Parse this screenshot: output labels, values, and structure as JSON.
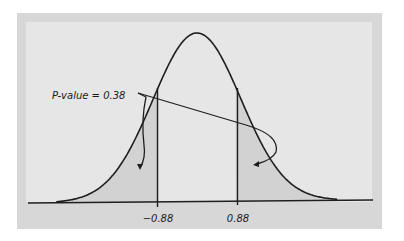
{
  "chart_data": {
    "type": "area",
    "title": "",
    "xlabel": "",
    "ylabel": "",
    "distribution": "standard normal",
    "mean": 0,
    "sd": 1,
    "xlim": [
      -3.2,
      3.2
    ],
    "tick_labels": [
      "-0.88",
      "0.88"
    ],
    "ticks": [
      -0.88,
      0.88
    ],
    "shaded_regions": [
      {
        "from": "-inf",
        "to": -0.88,
        "label": "left tail"
      },
      {
        "from": 0.88,
        "to": "inf",
        "label": "right tail"
      }
    ],
    "annotation": {
      "text": "P-value = 0.38",
      "value": 0.38,
      "points_to": [
        "left tail",
        "right tail"
      ]
    },
    "grid": false,
    "legend": null
  },
  "labels": {
    "annotation": "P-value = 0.38",
    "tick_left": "−0.88",
    "tick_right": "0.88"
  },
  "colors": {
    "outer_panel": "#d7d7d7",
    "inner_panel": "#e6e6e6",
    "shade": "#d2d2d2",
    "curve": "#1e1e1e",
    "axis": "#1e1e1e"
  }
}
